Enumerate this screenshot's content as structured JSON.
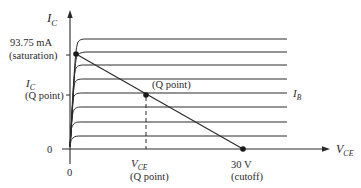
{
  "diagram": {
    "type": "transistor-output-characteristics-with-dc-load-line",
    "y_axis": {
      "symbol": "I",
      "subscript": "C"
    },
    "x_axis": {
      "symbol": "V",
      "subscript": "CE"
    },
    "origin_x_label": "0",
    "origin_y_label": "0",
    "saturation": {
      "value": "93.75 mA",
      "note": "(saturation)"
    },
    "cutoff": {
      "value": "30 V",
      "note": "(cutoff)"
    },
    "q_point": {
      "label": "(Q point)"
    },
    "ic_q": {
      "symbol": "I",
      "subscript": "C",
      "note": "(Q point)"
    },
    "vce_q": {
      "symbol": "V",
      "subscript": "CE",
      "note": "(Q point)"
    },
    "family_label": {
      "symbol": "I",
      "subscript": "B"
    },
    "curve_count": 8,
    "colors": {
      "ink": "#2a2a2a",
      "background": "#ffffff"
    }
  }
}
